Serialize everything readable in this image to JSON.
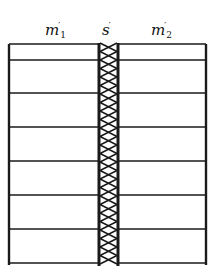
{
  "labels": {
    "left": {
      "base": "m",
      "prime": "′",
      "sub": "1"
    },
    "middle": {
      "base": "s",
      "prime": "′",
      "sub": ""
    },
    "right": {
      "base": "m",
      "prime": "′",
      "sub": "2"
    }
  },
  "layout": {
    "left_x": 9,
    "right_x": 206,
    "strip_left_x": 98,
    "strip_right_x": 119,
    "top_y": 44,
    "bottom_y": 263,
    "rows_y": [
      44,
      60,
      93,
      127,
      161,
      195,
      229,
      263
    ]
  },
  "colors": {
    "line": "#1a1a1a",
    "background": "#ffffff"
  }
}
